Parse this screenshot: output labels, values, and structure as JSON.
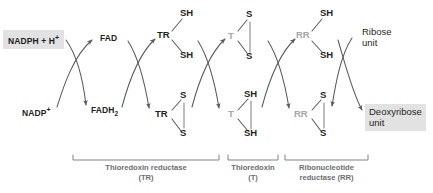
{
  "diagram": {
    "colors": {
      "ink": "#231f20",
      "gray_text": "#a6a6a6",
      "caption": "#6d6e71",
      "highlight_box": "#e2e2e2",
      "arrow": "#58595b"
    },
    "inputs": {
      "nadph": "NADPH + H",
      "nadph_sup": "+",
      "nadp": "NADP",
      "nadp_sup": "+"
    },
    "cofactors": {
      "fad": "FAD",
      "fadh2_base": "FADH",
      "fadh2_sub": "2"
    },
    "enzymes": {
      "tr": "TR",
      "t": "T",
      "rr": "RR"
    },
    "thiols": {
      "sh": "SH",
      "s": "S"
    },
    "redox_states": {
      "tr_top": [
        "SH",
        "SH"
      ],
      "tr_bottom": [
        "S",
        "S"
      ],
      "t_top": [
        "S",
        "S"
      ],
      "t_bottom": [
        "SH",
        "SH"
      ],
      "rr_top": [
        "SH",
        "SH"
      ],
      "rr_bottom": [
        "S",
        "S"
      ]
    },
    "products": {
      "ribose_line1": "Ribose",
      "ribose_line2": "unit",
      "deoxyribose_line1": "Deoxyribose",
      "deoxyribose_line2": "unit"
    },
    "brackets": [
      {
        "name": "thioredoxin-reductase",
        "line1": "Thioredoxin reductase",
        "line2": "(TR)"
      },
      {
        "name": "thioredoxin",
        "line1": "Thioredoxin",
        "line2": "(T)"
      },
      {
        "name": "ribonucleotide-reductase",
        "line1": "Ribonucleotide",
        "line2": "reductase (RR)"
      }
    ]
  }
}
